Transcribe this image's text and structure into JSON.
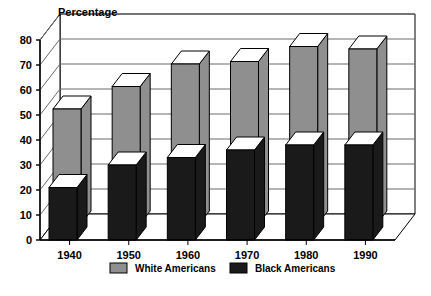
{
  "chart_data": {
    "type": "bar",
    "title": "Percentage",
    "xlabel": "",
    "ylabel": "Percentage",
    "ylim": [
      0,
      80
    ],
    "yticks": [
      0,
      10,
      20,
      30,
      40,
      50,
      60,
      70,
      80
    ],
    "grid": true,
    "legend_position": "bottom",
    "style": "3d-clustered-bar",
    "categories": [
      "1940",
      "1950",
      "1960",
      "1970",
      "1980",
      "1990"
    ],
    "series": [
      {
        "name": "White Americans",
        "color": "#8f8f8f",
        "values": [
          46,
          55,
          64,
          65,
          71,
          70
        ]
      },
      {
        "name": "Black Americans",
        "color": "#1a1a1a",
        "values": [
          21,
          30,
          33,
          36,
          38,
          38
        ]
      }
    ]
  },
  "legend": {
    "items": [
      {
        "label": "White Americans",
        "color": "#8f8f8f"
      },
      {
        "label": "Black Americans",
        "color": "#1a1a1a"
      }
    ]
  },
  "colors": {
    "white_series": "#8f8f8f",
    "black_series": "#1a1a1a",
    "axis": "#000000",
    "grid": "#6a6a6a",
    "background": "#ffffff"
  }
}
